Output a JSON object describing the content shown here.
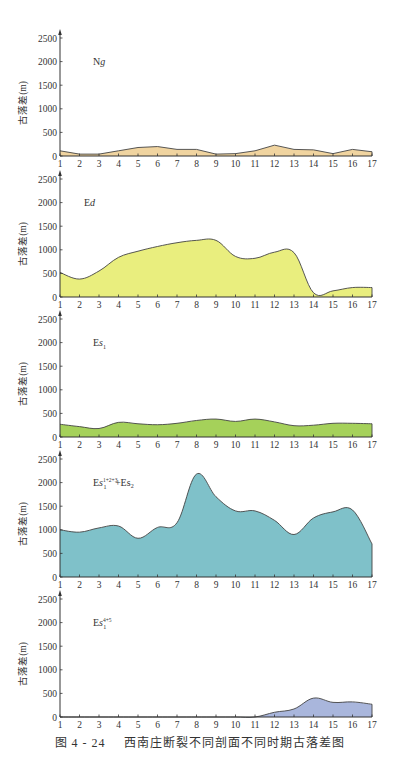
{
  "figure": {
    "caption_number": "图 4 - 24",
    "caption_title": "西南庄断裂不同剖面不同时期古落差图"
  },
  "chart_data": [
    {
      "type": "area",
      "title": "Ng",
      "label_main": "N",
      "label_italic": "g",
      "label_sub": "",
      "label_sup": "",
      "label_suffix": "",
      "ylabel": "古落差(m)",
      "xlabel": "",
      "x": [
        1,
        2,
        3,
        4,
        5,
        6,
        7,
        8,
        9,
        10,
        11,
        12,
        13,
        14,
        15,
        16,
        17
      ],
      "values": [
        110,
        40,
        40,
        110,
        180,
        200,
        140,
        140,
        40,
        50,
        110,
        230,
        140,
        130,
        50,
        140,
        90
      ],
      "ylim": [
        0,
        2500
      ],
      "yticks": [
        0,
        500,
        1000,
        1500,
        2000,
        2500
      ],
      "fill": "#f0d4a0",
      "grid": false,
      "smooth": false
    },
    {
      "type": "area",
      "title": "Ed",
      "label_main": "E",
      "label_italic": "d",
      "label_sub": "",
      "label_sup": "",
      "label_suffix": "",
      "ylabel": "古落差(m)",
      "xlabel": "",
      "x": [
        1,
        2,
        3,
        4,
        5,
        6,
        7,
        8,
        9,
        10,
        11,
        12,
        13,
        14,
        15,
        16,
        17
      ],
      "values": [
        520,
        380,
        550,
        840,
        970,
        1070,
        1150,
        1200,
        1200,
        860,
        820,
        950,
        940,
        90,
        130,
        200,
        200
      ],
      "ylim": [
        0,
        2500
      ],
      "yticks": [
        0,
        500,
        1000,
        1500,
        2000,
        2500
      ],
      "fill": "#e9ee7e",
      "grid": false,
      "smooth": true
    },
    {
      "type": "area",
      "title": "Es1",
      "label_main": "E",
      "label_italic": "s",
      "label_sub": "1",
      "label_sup": "",
      "label_suffix": "",
      "ylabel": "古落差(m)",
      "xlabel": "",
      "x": [
        1,
        2,
        3,
        4,
        5,
        6,
        7,
        8,
        9,
        10,
        11,
        12,
        13,
        14,
        15,
        16,
        17
      ],
      "values": [
        270,
        220,
        180,
        310,
        280,
        260,
        290,
        350,
        380,
        330,
        380,
        320,
        240,
        250,
        290,
        290,
        280
      ],
      "ylim": [
        0,
        2500
      ],
      "yticks": [
        0,
        500,
        1000,
        1500,
        2000,
        2500
      ],
      "fill": "#a5d15a",
      "grid": false,
      "smooth": true
    },
    {
      "type": "area",
      "title": "Es1(1+2+3) + Es2",
      "label_main": "E",
      "label_italic": "s",
      "label_sub": "1",
      "label_sup": "1+2+3",
      "label_suffix": " +Es₂",
      "ylabel": "古落差(m)",
      "xlabel": "",
      "x": [
        1,
        2,
        3,
        4,
        5,
        6,
        7,
        8,
        9,
        10,
        11,
        12,
        13,
        14,
        15,
        16,
        17
      ],
      "values": [
        1000,
        950,
        1040,
        1080,
        820,
        1050,
        1150,
        2180,
        1700,
        1400,
        1400,
        1200,
        900,
        1250,
        1380,
        1420,
        700
      ],
      "ylim": [
        0,
        2500
      ],
      "yticks": [
        0,
        500,
        1000,
        1500,
        2000,
        2500
      ],
      "fill": "#7fc1c9",
      "grid": false,
      "smooth": true
    },
    {
      "type": "area",
      "title": "Es1(4+5)",
      "label_main": "E",
      "label_italic": "s",
      "label_sub": "1",
      "label_sup": "4+5",
      "label_suffix": "",
      "ylabel": "古落差(m)",
      "xlabel": "",
      "x": [
        1,
        2,
        3,
        4,
        5,
        6,
        7,
        8,
        9,
        10,
        11,
        12,
        13,
        14,
        15,
        16,
        17
      ],
      "values": [
        0,
        0,
        0,
        0,
        0,
        0,
        0,
        0,
        0,
        0,
        0,
        100,
        170,
        400,
        310,
        320,
        270
      ],
      "ylim": [
        0,
        2500
      ],
      "yticks": [
        0,
        500,
        1000,
        1500,
        2000,
        2500
      ],
      "fill": "#a9b6dc",
      "grid": false,
      "smooth": true
    }
  ],
  "layout": {
    "panel_origins_y": [
      156,
      297,
      437,
      577,
      717
    ],
    "plot_height_px": 118,
    "x_left_px": 60,
    "x_right_px": 372
  }
}
